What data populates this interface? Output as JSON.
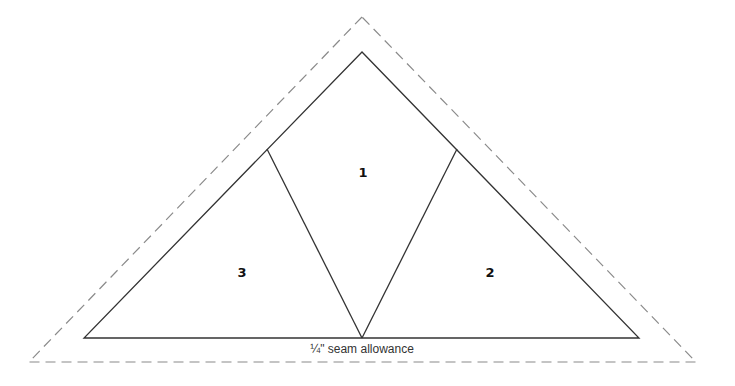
{
  "diagram": {
    "type": "quilt-pattern-triangle",
    "pieces": [
      {
        "id": "piece-1",
        "label": "1"
      },
      {
        "id": "piece-2",
        "label": "2"
      },
      {
        "id": "piece-3",
        "label": "3"
      }
    ],
    "caption": "¼\" seam allowance",
    "colors": {
      "outline": "#333333",
      "seam": "#888888",
      "background": "#ffffff"
    }
  }
}
